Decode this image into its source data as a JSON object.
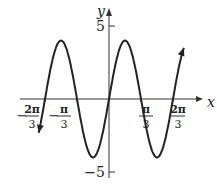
{
  "chart_data": {
    "type": "line",
    "title": "",
    "function": "y = 4 sin(3x)",
    "xlabel": "x",
    "ylabel": "y",
    "xlim": [
      -2.4,
      2.6
    ],
    "ylim": [
      -5.5,
      6
    ],
    "x_ticks": [
      {
        "num": "2π",
        "den": "3",
        "sign": "−",
        "value": -2.0944
      },
      {
        "num": "π",
        "den": "3",
        "sign": "−",
        "value": -1.0472
      },
      {
        "num": "π",
        "den": "3",
        "sign": "",
        "value": 1.0472
      },
      {
        "num": "2π",
        "den": "3",
        "sign": "",
        "value": 2.0944
      }
    ],
    "y_ticks": [
      {
        "label": "5",
        "value": 5
      },
      {
        "label": "−5",
        "value": -5
      }
    ],
    "series": [
      {
        "name": "4sin(3x)",
        "amplitude": 4,
        "period": "2π/3"
      }
    ],
    "grid": false,
    "legend": "none"
  }
}
